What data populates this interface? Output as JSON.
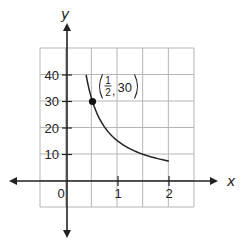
{
  "chart_data": {
    "type": "line",
    "title": "",
    "xlabel": "x",
    "ylabel": "y",
    "xlim": [
      -0.5,
      2.5
    ],
    "ylim": [
      -10,
      50
    ],
    "grid": true,
    "x_ticks": [
      {
        "value": 1,
        "label": "1"
      },
      {
        "value": 2,
        "label": "2"
      }
    ],
    "y_ticks": [
      {
        "value": 10,
        "label": "10"
      },
      {
        "value": 20,
        "label": "20"
      },
      {
        "value": 30,
        "label": "30"
      },
      {
        "value": 40,
        "label": "40"
      }
    ],
    "origin_label": "0",
    "series": [
      {
        "name": "y = 15/x",
        "x": [
          0.375,
          0.5,
          0.75,
          1,
          1.25,
          1.5,
          1.75,
          2
        ],
        "values": [
          40,
          30,
          20,
          15,
          12,
          10,
          8.57,
          7.5
        ]
      }
    ],
    "highlighted_point": {
      "x": 0.5,
      "y": 30
    },
    "annotation": {
      "numerator": "1",
      "denominator": "2",
      "y_text": "30"
    }
  }
}
